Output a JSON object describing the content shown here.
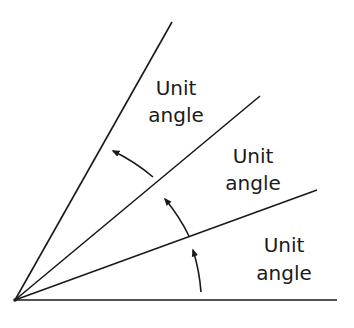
{
  "diagram": {
    "type": "angle-units",
    "line_color": "#1a1a1a",
    "background": "#ffffff",
    "labels": [
      {
        "line1": "Unit",
        "line2": "angle"
      },
      {
        "line1": "Unit",
        "line2": "angle"
      },
      {
        "line1": "Unit",
        "line2": "angle"
      }
    ]
  }
}
